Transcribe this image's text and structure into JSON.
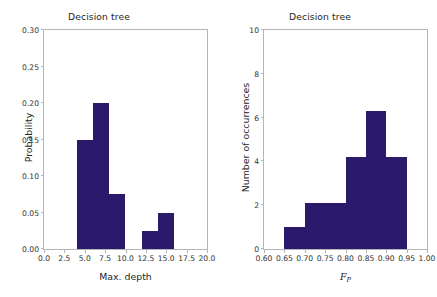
{
  "figure": {
    "width": 437,
    "height": 297,
    "background": "#ffffff",
    "bar_color": "#2b1a6b",
    "axis_color": "#b5b5b5"
  },
  "chart_data": [
    {
      "type": "bar",
      "id": "max-depth-histogram",
      "title": "Decision tree",
      "xlabel": "Max. depth",
      "ylabel": "Probability",
      "xlim": [
        0.0,
        20.0
      ],
      "ylim": [
        0.0,
        0.3
      ],
      "grid": false,
      "legend": null,
      "xticks": [
        0.0,
        2.5,
        5.0,
        7.5,
        10.0,
        12.5,
        15.0,
        17.5,
        20.0
      ],
      "xticklabels": [
        "0.0",
        "2.5",
        "5.0",
        "7.5",
        "10.0",
        "12.5",
        "15.0",
        "17.5",
        "20.0"
      ],
      "yticks": [
        0.0,
        0.05,
        0.1,
        0.15,
        0.2,
        0.25,
        0.3
      ],
      "yticklabels": [
        "0.00",
        "0.05",
        "0.10",
        "0.15",
        "0.20",
        "0.25",
        "0.30"
      ],
      "bars": [
        {
          "x0": 4.0,
          "x1": 6.0,
          "value": 0.15
        },
        {
          "x0": 6.0,
          "x1": 8.0,
          "value": 0.2
        },
        {
          "x0": 8.0,
          "x1": 10.0,
          "value": 0.075
        },
        {
          "x0": 12.0,
          "x1": 14.0,
          "value": 0.025
        },
        {
          "x0": 14.0,
          "x1": 16.0,
          "value": 0.05
        }
      ],
      "color": "#2b1a6b"
    },
    {
      "type": "bar",
      "id": "fp-histogram",
      "title": "Decision tree",
      "xlabel": "F_P",
      "ylabel": "Number of occurrences",
      "xlim": [
        0.6,
        1.0
      ],
      "ylim": [
        0,
        10
      ],
      "grid": false,
      "legend": null,
      "xticks": [
        0.6,
        0.65,
        0.7,
        0.75,
        0.8,
        0.85,
        0.9,
        0.95,
        1.0
      ],
      "xticklabels": [
        "0.60",
        "0.65",
        "0.70",
        "0.75",
        "0.80",
        "0.85",
        "0.90",
        "0.95",
        "1.00"
      ],
      "yticks": [
        0,
        2,
        4,
        6,
        8,
        10
      ],
      "yticklabels": [
        "0",
        "2",
        "4",
        "6",
        "8",
        "10"
      ],
      "bars": [
        {
          "x0": 0.65,
          "x1": 0.7,
          "value": 1.0
        },
        {
          "x0": 0.7,
          "x1": 0.8,
          "value": 2.1
        },
        {
          "x0": 0.8,
          "x1": 0.85,
          "value": 4.2
        },
        {
          "x0": 0.85,
          "x1": 0.9,
          "value": 6.3
        },
        {
          "x0": 0.9,
          "x1": 0.95,
          "value": 4.2
        }
      ],
      "color": "#2b1a6b"
    }
  ],
  "left_panel": {
    "title": "Decision tree",
    "xlabel": "Max. depth",
    "ylabel": "Probability"
  },
  "right_panel": {
    "title": "Decision tree",
    "ylabel": "Number of occurrences",
    "xlabel_base": "F",
    "xlabel_sub": "P"
  }
}
